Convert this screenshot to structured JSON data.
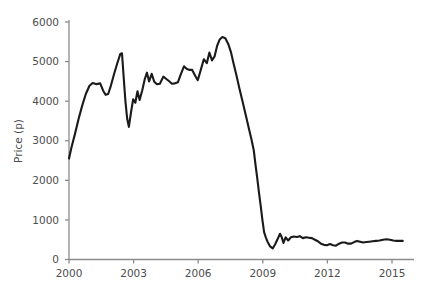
{
  "chart_data": {
    "type": "line",
    "title": "",
    "subtitle": "",
    "xlabel": "",
    "ylabel": "Price (p)",
    "xlim": [
      2000,
      2015.6
    ],
    "ylim": [
      0,
      6000
    ],
    "grid": false,
    "legend": null,
    "x_ticks": [
      2000,
      2003,
      2006,
      2009,
      2012,
      2015
    ],
    "x_tick_labels": [
      "2000",
      "2003",
      "2006",
      "2009",
      "2012",
      "2015"
    ],
    "y_ticks": [
      0,
      1000,
      2000,
      3000,
      4000,
      5000,
      6000
    ],
    "y_tick_labels": [
      "0",
      "1000",
      "2000",
      "3000",
      "4000",
      "5000",
      "6000"
    ],
    "series": [
      {
        "name": "Price",
        "color": "#1a1a1a",
        "points": [
          [
            2000.0,
            2550
          ],
          [
            2000.12,
            2840
          ],
          [
            2000.28,
            3180
          ],
          [
            2000.45,
            3560
          ],
          [
            2000.62,
            3900
          ],
          [
            2000.78,
            4180
          ],
          [
            2000.95,
            4390
          ],
          [
            2001.1,
            4460
          ],
          [
            2001.28,
            4430
          ],
          [
            2001.45,
            4450
          ],
          [
            2001.58,
            4270
          ],
          [
            2001.7,
            4160
          ],
          [
            2001.82,
            4180
          ],
          [
            2001.95,
            4400
          ],
          [
            2002.1,
            4700
          ],
          [
            2002.25,
            4970
          ],
          [
            2002.38,
            5190
          ],
          [
            2002.46,
            5210
          ],
          [
            2002.54,
            4600
          ],
          [
            2002.62,
            4000
          ],
          [
            2002.7,
            3560
          ],
          [
            2002.78,
            3350
          ],
          [
            2002.88,
            3720
          ],
          [
            2002.98,
            4050
          ],
          [
            2003.08,
            3960
          ],
          [
            2003.18,
            4250
          ],
          [
            2003.28,
            4030
          ],
          [
            2003.4,
            4270
          ],
          [
            2003.52,
            4560
          ],
          [
            2003.62,
            4720
          ],
          [
            2003.72,
            4500
          ],
          [
            2003.84,
            4690
          ],
          [
            2003.96,
            4490
          ],
          [
            2004.08,
            4430
          ],
          [
            2004.22,
            4440
          ],
          [
            2004.38,
            4620
          ],
          [
            2004.52,
            4560
          ],
          [
            2004.64,
            4510
          ],
          [
            2004.78,
            4440
          ],
          [
            2004.92,
            4450
          ],
          [
            2005.06,
            4480
          ],
          [
            2005.2,
            4690
          ],
          [
            2005.34,
            4880
          ],
          [
            2005.46,
            4820
          ],
          [
            2005.58,
            4790
          ],
          [
            2005.72,
            4790
          ],
          [
            2005.86,
            4640
          ],
          [
            2005.98,
            4530
          ],
          [
            2006.12,
            4790
          ],
          [
            2006.26,
            5060
          ],
          [
            2006.4,
            4960
          ],
          [
            2006.52,
            5230
          ],
          [
            2006.64,
            5030
          ],
          [
            2006.76,
            5130
          ],
          [
            2006.88,
            5400
          ],
          [
            2007.0,
            5560
          ],
          [
            2007.12,
            5620
          ],
          [
            2007.26,
            5590
          ],
          [
            2007.4,
            5440
          ],
          [
            2007.52,
            5240
          ],
          [
            2007.64,
            4960
          ],
          [
            2007.78,
            4640
          ],
          [
            2007.92,
            4310
          ],
          [
            2008.06,
            3990
          ],
          [
            2008.2,
            3670
          ],
          [
            2008.34,
            3340
          ],
          [
            2008.48,
            3020
          ],
          [
            2008.58,
            2760
          ],
          [
            2008.66,
            2400
          ],
          [
            2008.74,
            2060
          ],
          [
            2008.82,
            1700
          ],
          [
            2008.9,
            1370
          ],
          [
            2008.98,
            1010
          ],
          [
            2009.06,
            690
          ],
          [
            2009.14,
            560
          ],
          [
            2009.22,
            450
          ],
          [
            2009.34,
            330
          ],
          [
            2009.46,
            280
          ],
          [
            2009.58,
            390
          ],
          [
            2009.7,
            530
          ],
          [
            2009.8,
            650
          ],
          [
            2009.88,
            560
          ],
          [
            2009.96,
            420
          ],
          [
            2010.06,
            560
          ],
          [
            2010.18,
            480
          ],
          [
            2010.3,
            560
          ],
          [
            2010.44,
            580
          ],
          [
            2010.58,
            570
          ],
          [
            2010.72,
            590
          ],
          [
            2010.86,
            540
          ],
          [
            2011.0,
            560
          ],
          [
            2011.14,
            550
          ],
          [
            2011.28,
            540
          ],
          [
            2011.42,
            500
          ],
          [
            2011.56,
            460
          ],
          [
            2011.7,
            400
          ],
          [
            2011.84,
            370
          ],
          [
            2011.98,
            360
          ],
          [
            2012.12,
            390
          ],
          [
            2012.26,
            360
          ],
          [
            2012.4,
            350
          ],
          [
            2012.54,
            400
          ],
          [
            2012.68,
            430
          ],
          [
            2012.82,
            430
          ],
          [
            2012.96,
            400
          ],
          [
            2013.1,
            400
          ],
          [
            2013.24,
            440
          ],
          [
            2013.38,
            470
          ],
          [
            2013.52,
            450
          ],
          [
            2013.66,
            430
          ],
          [
            2013.8,
            440
          ],
          [
            2013.94,
            450
          ],
          [
            2014.1,
            460
          ],
          [
            2014.26,
            470
          ],
          [
            2014.42,
            480
          ],
          [
            2014.58,
            500
          ],
          [
            2014.74,
            510
          ],
          [
            2014.9,
            500
          ],
          [
            2015.06,
            480
          ],
          [
            2015.22,
            470
          ],
          [
            2015.38,
            470
          ],
          [
            2015.5,
            470
          ]
        ]
      }
    ]
  },
  "axes": {
    "y_title": "Price (p)",
    "x_title": ""
  },
  "colors": {
    "series": "#1a1a1a",
    "axis": "#8c8c8c",
    "text": "#4d4d4d",
    "background": "#ffffff"
  }
}
